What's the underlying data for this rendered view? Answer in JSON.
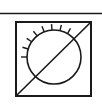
{
  "symbol": {
    "title": "Light sensor with backlight-off symbol",
    "stroke_color": "#1a1a1a",
    "background": "#ffffff",
    "top_rule": {
      "x1": 0,
      "y1": 13.5,
      "x2": 102,
      "y2": 13.5
    },
    "frame": {
      "x": 16,
      "y": 22,
      "width": 75,
      "height": 74
    },
    "circle": {
      "cx": 54,
      "cy": 57,
      "r": 27
    },
    "diagonal": {
      "x1": 16,
      "y1": 96,
      "x2": 91,
      "y2": 22
    },
    "rays": {
      "count": 8,
      "start_deg": 180,
      "end_deg": 300,
      "length": 6
    }
  }
}
